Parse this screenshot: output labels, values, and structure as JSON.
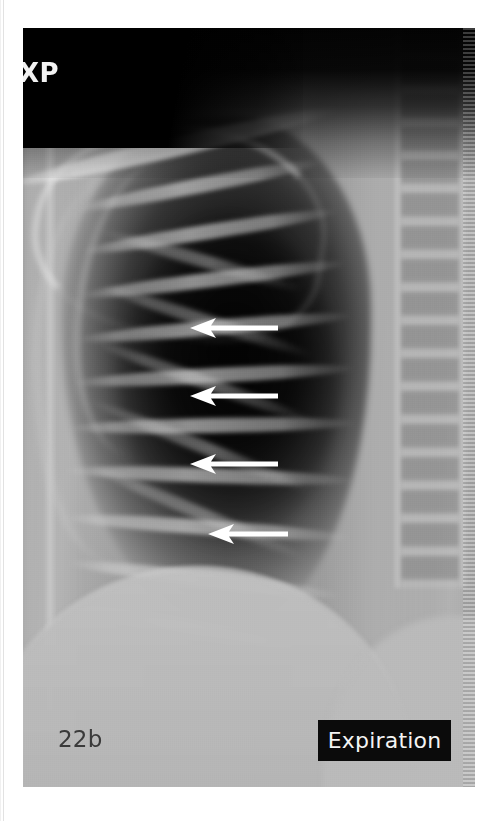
{
  "figure": {
    "label": "22b",
    "phase_label": "Expiration",
    "modality_marker": "XP",
    "marker_subtext": "",
    "colors": {
      "arrow": "#ffffff",
      "phase_box_background": "#0b0b0b",
      "phase_box_text": "#f4f4f4",
      "figure_label_text": "#3a3a3a",
      "marker_text": "#f2f2f2",
      "page_background": "#ffffff"
    }
  },
  "annotations": {
    "arrows": [
      {
        "id": "arrow-1",
        "direction": "left",
        "left": 167,
        "top": 289,
        "length": 88
      },
      {
        "id": "arrow-2",
        "direction": "left",
        "left": 167,
        "top": 357,
        "length": 88
      },
      {
        "id": "arrow-3",
        "direction": "left",
        "left": 167,
        "top": 425,
        "length": 88
      },
      {
        "id": "arrow-4",
        "direction": "left",
        "left": 185,
        "top": 495,
        "length": 80
      }
    ]
  },
  "radiograph": {
    "ribs_posterior": [
      {
        "left": 52,
        "top": 150,
        "width": 250,
        "rotate": -11
      },
      {
        "left": 58,
        "top": 196,
        "width": 258,
        "rotate": -9
      },
      {
        "left": 56,
        "top": 244,
        "width": 268,
        "rotate": -7
      },
      {
        "left": 54,
        "top": 292,
        "width": 276,
        "rotate": -5
      },
      {
        "left": 50,
        "top": 340,
        "width": 282,
        "rotate": -3
      },
      {
        "left": 46,
        "top": 390,
        "width": 288,
        "rotate": -1
      },
      {
        "left": 42,
        "top": 440,
        "width": 290,
        "rotate": 2
      },
      {
        "left": 40,
        "top": 492,
        "width": 288,
        "rotate": 4
      },
      {
        "left": 44,
        "top": 544,
        "width": 276,
        "rotate": 7
      },
      {
        "left": 52,
        "top": 594,
        "width": 252,
        "rotate": 10
      }
    ],
    "ribs_anterior": [
      {
        "left": 74,
        "top": 226,
        "width": 210,
        "rotate": 16
      },
      {
        "left": 70,
        "top": 286,
        "width": 224,
        "rotate": 18
      },
      {
        "left": 64,
        "top": 348,
        "width": 236,
        "rotate": 20
      },
      {
        "left": 58,
        "top": 412,
        "width": 242,
        "rotate": 22
      },
      {
        "left": 56,
        "top": 478,
        "width": 238,
        "rotate": 23
      }
    ]
  }
}
